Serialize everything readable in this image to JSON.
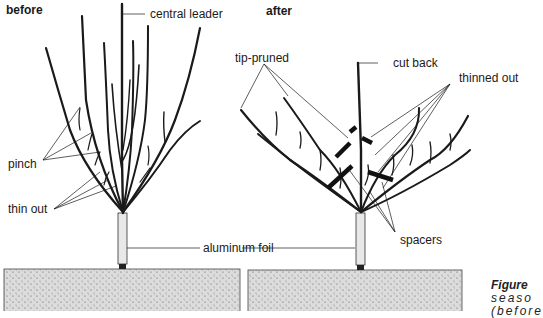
{
  "panels": {
    "before": {
      "heading": "before",
      "labels": {
        "central_leader": "central leader",
        "pinch": "pinch",
        "thin_out": "thin out",
        "aluminum_foil": "aluminum foil"
      }
    },
    "after": {
      "heading": "after",
      "labels": {
        "tip_pruned": "tip-pruned",
        "cut_back": "cut back",
        "thinned_out": "thinned out",
        "spacers": "spacers"
      }
    }
  },
  "caption": {
    "figure": "Figure",
    "line2": "seaso",
    "line3": "(before"
  },
  "colors": {
    "ink": "#1a1a1a",
    "soil": "#d8d8d8",
    "foil": "#e8e8e8"
  }
}
